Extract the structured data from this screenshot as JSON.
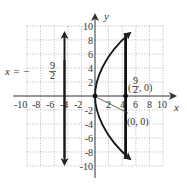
{
  "diagram": {
    "type": "parabola-graph",
    "equation_implied": "y^2 = 18x",
    "axes": {
      "x_label": "x",
      "y_label": "y",
      "x_range": [
        -10,
        10
      ],
      "y_range": [
        -10,
        10
      ],
      "grid_step": 2,
      "grid_style": "dotted",
      "x_ticks": [
        "-10",
        "-8",
        "-6",
        "-4",
        "-2",
        "2",
        "4",
        "6",
        "8",
        "10"
      ],
      "y_ticks": [
        "10",
        "8",
        "6",
        "4",
        "2",
        "-2",
        "-4",
        "-6",
        "-8",
        "-10"
      ]
    },
    "directrix": {
      "label_prefix": "x = −",
      "label_num": "9",
      "label_den": "2",
      "x": -4.5
    },
    "focus": {
      "label_open": "(",
      "label_num": "9",
      "label_den": "2",
      "label_close": ", 0)",
      "x": 4.5,
      "y": 0
    },
    "vertex": {
      "label": "(0, 0)",
      "x": 0,
      "y": 0
    },
    "latus_rectum_x": 4.5,
    "colors": {
      "curve": "#1a1a1a",
      "grid": "#888888",
      "axes": "#333333",
      "text": "#333333"
    }
  }
}
